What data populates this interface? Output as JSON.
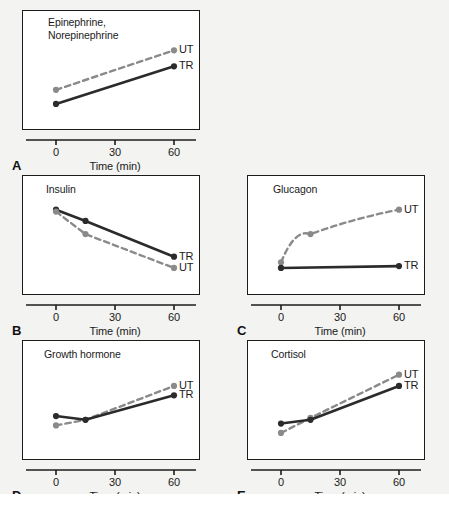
{
  "figure": {
    "background_color": "#f3f3f1",
    "panel_background": "#ffffff",
    "axis_color": "#1c1c1c"
  },
  "series_styles": {
    "TR": {
      "label": "TR",
      "color": "#2b2b2b",
      "style": "solid"
    },
    "UT": {
      "label": "UT",
      "color": "#8a8a8a",
      "style": "dashed"
    }
  },
  "chart_data": [
    {
      "type": "line",
      "panel": "A",
      "title": "Epinephrine,\nNorepinephrine",
      "xlabel": "Time (min)",
      "ylabel": "",
      "xticks": [
        0,
        30,
        60
      ],
      "xlim": [
        0,
        60
      ],
      "ylim": [
        0,
        100
      ],
      "grid": false,
      "legend": "right-inline",
      "series": [
        {
          "name": "UT",
          "x": [
            0,
            60
          ],
          "values": [
            30,
            72
          ]
        },
        {
          "name": "TR",
          "x": [
            0,
            60
          ],
          "values": [
            15,
            55
          ]
        }
      ]
    },
    {
      "type": "line",
      "panel": "B",
      "title": "Insulin",
      "xlabel": "Time (min)",
      "ylabel": "",
      "xticks": [
        0,
        30,
        60
      ],
      "xlim": [
        0,
        60
      ],
      "ylim": [
        0,
        100
      ],
      "grid": false,
      "legend": "right-inline",
      "series": [
        {
          "name": "TR",
          "x": [
            0,
            15,
            60
          ],
          "values": [
            78,
            66,
            28
          ]
        },
        {
          "name": "UT",
          "x": [
            0,
            15,
            60
          ],
          "values": [
            76,
            52,
            16
          ]
        }
      ]
    },
    {
      "type": "line",
      "panel": "C",
      "title": "Glucagon",
      "xlabel": "Time (min)",
      "ylabel": "",
      "xticks": [
        0,
        30,
        60
      ],
      "xlim": [
        0,
        60
      ],
      "ylim": [
        0,
        100
      ],
      "grid": false,
      "legend": "right-inline",
      "series": [
        {
          "name": "UT",
          "x": [
            0,
            15,
            60
          ],
          "values": [
            22,
            52,
            78
          ]
        },
        {
          "name": "TR",
          "x": [
            0,
            60
          ],
          "values": [
            16,
            18
          ]
        }
      ]
    },
    {
      "type": "line",
      "panel": "D",
      "title": "Growth hormone",
      "xlabel": "Time (min)",
      "ylabel": "",
      "xticks": [
        0,
        30,
        60
      ],
      "xlim": [
        0,
        60
      ],
      "ylim": [
        0,
        100
      ],
      "grid": false,
      "legend": "right-inline",
      "series": [
        {
          "name": "UT",
          "x": [
            0,
            15,
            60
          ],
          "values": [
            24,
            30,
            66
          ]
        },
        {
          "name": "TR",
          "x": [
            0,
            15,
            60
          ],
          "values": [
            34,
            30,
            56
          ]
        }
      ]
    },
    {
      "type": "line",
      "panel": "E",
      "title": "Cortisol",
      "xlabel": "Time (min)",
      "ylabel": "",
      "xticks": [
        0,
        30,
        60
      ],
      "xlim": [
        0,
        60
      ],
      "ylim": [
        0,
        100
      ],
      "grid": false,
      "legend": "right-inline",
      "series": [
        {
          "name": "UT",
          "x": [
            0,
            15,
            60
          ],
          "values": [
            16,
            32,
            78
          ]
        },
        {
          "name": "TR",
          "x": [
            0,
            15,
            60
          ],
          "values": [
            26,
            30,
            66
          ]
        }
      ]
    }
  ]
}
